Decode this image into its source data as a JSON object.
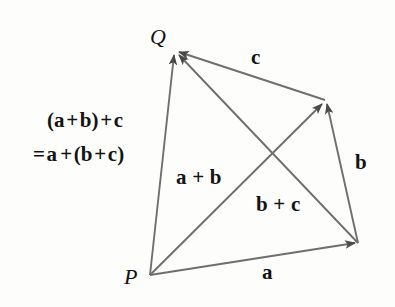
{
  "figure": {
    "background_color": "#fdfdfc",
    "stroke_color": "#6f6f6f",
    "arrow_color": "#4a4a4a",
    "text_color": "#141414"
  },
  "points": {
    "p": {
      "label": "P",
      "x": 150,
      "y": 275
    },
    "q": {
      "label": "Q",
      "x": 175,
      "y": 50
    },
    "r": {
      "label": "",
      "x": 325,
      "y": 100
    },
    "s": {
      "label": "",
      "x": 358,
      "y": 243
    }
  },
  "vectors": [
    {
      "name": "a",
      "label": "a",
      "from": "p",
      "to": "s",
      "label_x": 267,
      "label_y": 273
    },
    {
      "name": "b",
      "label": "b",
      "from": "s",
      "to": "r",
      "label_x": 360,
      "label_y": 163
    },
    {
      "name": "c",
      "label": "c",
      "from": "r",
      "to": "q",
      "label_x": 256,
      "label_y": 58
    },
    {
      "name": "a-plus-b",
      "label": "a + b",
      "from": "p",
      "to": "r",
      "label_x": 202,
      "label_y": 178
    },
    {
      "name": "b-plus-c",
      "label": "b + c",
      "from": "s",
      "to": "q",
      "label_x": 283,
      "label_y": 205
    },
    {
      "name": "resultant",
      "label": "(a + b) + c = a + (b + c)",
      "from": "p",
      "to": "q"
    }
  ],
  "labels": {
    "point_p": "P",
    "point_q": "Q",
    "vector_a": "a",
    "vector_b": "b",
    "vector_c": "c",
    "sum_ab": "a + b",
    "sum_bc": "b + c",
    "equation_line1": {
      "open_paren": "(",
      "term_a": "a",
      "plus1": "+",
      "term_b": "b",
      "close_paren": ")",
      "plus2": "+",
      "term_c": "c"
    },
    "equation_line2": {
      "equals": "=",
      "term_a": "a",
      "plus1": "+",
      "open_paren": "(",
      "term_b": "b",
      "plus2": "+",
      "term_c": "c",
      "close_paren": ")"
    }
  }
}
